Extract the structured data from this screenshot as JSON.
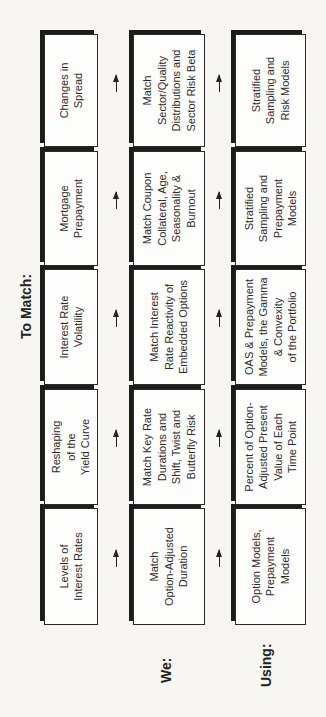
{
  "labels": {
    "to_match": "To Match:",
    "we": "We:",
    "using": "Using:"
  },
  "columns": [
    {
      "risk": "Levels of\nInterest Rates",
      "we": "Match\nOption-Adjusted\nDuration",
      "using": "Option Models,\nPrepayment\nModels"
    },
    {
      "risk": "Reshaping\nof the\nYield Curve",
      "we": "Match Key Rate\nDurations and\nShift, Twist and\nButterfly Risk",
      "using": "Percent of Option-\nAdjusted Present\nValue of Each\nTime Point"
    },
    {
      "risk": "Interest Rate\nVolatility",
      "we": "Match Interest\nRate Reactivity of\nEmbedded Options",
      "using": "OAS & Prepayment\nModels, the Gamma\n& Convexity\nof the Portfolio"
    },
    {
      "risk": "Mortgage\nPrepayment",
      "we": "Match Coupon\nCollateral, Age,\nSeasonality &\nBurnout",
      "using": "Stratified\nSampling and\nPrepayment\nModels"
    },
    {
      "risk": "Changes in\nSpread",
      "we": "Match\nSector/Quality\nDistributions and\nSector Risk Beta",
      "using": "Stratified\nSampling and\nRisk Models"
    }
  ],
  "colors": {
    "box_border": "#2a2a2a",
    "shadow": "#1c1c1c",
    "background": "#f7f6f3",
    "text": "#2b2b2b"
  }
}
